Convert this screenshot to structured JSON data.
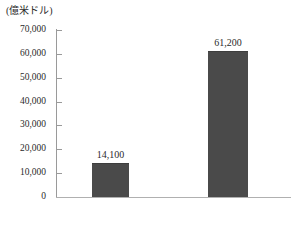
{
  "chart_data": {
    "type": "bar",
    "title": "",
    "subtitle": "",
    "unit_label": "(億米ドル)",
    "xlabel": "",
    "ylabel": "",
    "categories": [
      "2016",
      "2023（年）"
    ],
    "values": [
      14100,
      61200
    ],
    "value_labels": [
      "14,100",
      "61,200"
    ],
    "series": [
      {
        "name": "",
        "values": [
          14100,
          61200
        ]
      }
    ],
    "ylim": [
      0,
      70000
    ],
    "y_ticks": [
      0,
      10000,
      20000,
      30000,
      40000,
      50000,
      60000,
      70000
    ],
    "y_tick_labels": [
      "0",
      "10,000",
      "20,000",
      "30,000",
      "40,000",
      "50,000",
      "60,000",
      "70,000"
    ],
    "grid": false,
    "legend": false,
    "legend_position": "none",
    "bar_color": "#4a4a4a",
    "axis_color": "#9a9a9a",
    "text_color": "#2b2b2b"
  }
}
